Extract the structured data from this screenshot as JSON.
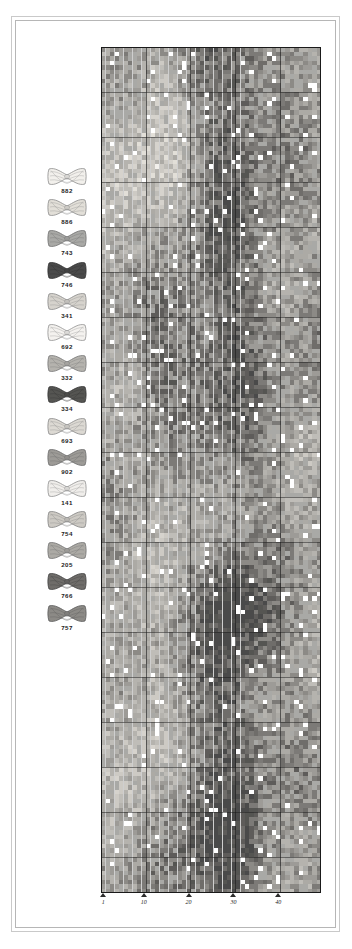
{
  "document": {
    "type": "cross-stitch-pattern-chart",
    "background_color": "#ffffff",
    "frame_color": "#c9c9c9"
  },
  "legend": {
    "title": "",
    "items": [
      {
        "code": "882",
        "color": "#f2f0ec",
        "outline": "#8d8d8d",
        "name": "skein-882"
      },
      {
        "code": "886",
        "color": "#e2dfd8",
        "outline": "#8a8a8a",
        "name": "skein-886"
      },
      {
        "code": "743",
        "color": "#a9a9a6",
        "outline": "#6e6e6e",
        "name": "skein-743"
      },
      {
        "code": "746",
        "color": "#4a4a4a",
        "outline": "#303030",
        "name": "skein-746"
      },
      {
        "code": "341",
        "color": "#d6d3cd",
        "outline": "#868686",
        "name": "skein-341"
      },
      {
        "code": "692",
        "color": "#f4f2ef",
        "outline": "#909090",
        "name": "skein-692"
      },
      {
        "code": "332",
        "color": "#b5b3ae",
        "outline": "#757575",
        "name": "skein-332"
      },
      {
        "code": "334",
        "color": "#555552",
        "outline": "#333333",
        "name": "skein-334"
      },
      {
        "code": "693",
        "color": "#dcd9d3",
        "outline": "#888888",
        "name": "skein-693"
      },
      {
        "code": "902",
        "color": "#9d9b97",
        "outline": "#6a6a6a",
        "name": "skein-902"
      },
      {
        "code": "141",
        "color": "#f0eeeb",
        "outline": "#8f8f8f",
        "name": "skein-141"
      },
      {
        "code": "754",
        "color": "#cdcac4",
        "outline": "#828282",
        "name": "skein-754"
      },
      {
        "code": "205",
        "color": "#acaaa5",
        "outline": "#707070",
        "name": "skein-205"
      },
      {
        "code": "766",
        "color": "#6f6d6a",
        "outline": "#404040",
        "name": "skein-766"
      },
      {
        "code": "757",
        "color": "#8c8a86",
        "outline": "#5a5a5a",
        "name": "skein-757"
      }
    ]
  },
  "chart_data": {
    "type": "heatmap",
    "title": "",
    "xlabel": "",
    "ylabel": "",
    "columns": 49,
    "rows": 188,
    "cell_size_px": 4.49,
    "grid": true,
    "grid_minor_color": "#cfcfcf",
    "grid_major_color": "#1a1a1a",
    "grid_major_every": 10,
    "border_color": "#1a1a1a",
    "x_axis": {
      "ticks": [
        1,
        10,
        20,
        30,
        40
      ],
      "tick_labels": [
        "1",
        "10",
        "20",
        "30",
        "40"
      ],
      "range": [
        1,
        49
      ]
    },
    "palette": [
      "#ffffff",
      "#f2f0ec",
      "#e2dfd8",
      "#d6d3cd",
      "#cdcac4",
      "#bfbdb8",
      "#b5b3ae",
      "#acaaa5",
      "#a9a9a6",
      "#9d9b97",
      "#8c8a86",
      "#7c7a77",
      "#6f6d6a",
      "#5e5c5a",
      "#555552",
      "#4a4a4a"
    ],
    "palette_codes": [
      "blank",
      "882",
      "886",
      "341",
      "754",
      "693",
      "332",
      "205",
      "743",
      "902",
      "757",
      "692-dk",
      "766",
      "334-lt",
      "334",
      "746"
    ],
    "noise_seed": 20240517
  }
}
